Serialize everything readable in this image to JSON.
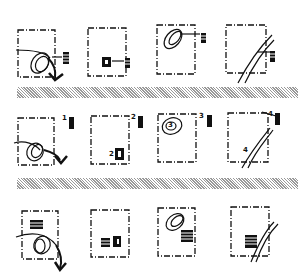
{
  "diagram": {
    "rows": 3,
    "columns": 4,
    "separators": 2,
    "row2_labels": [
      "1",
      "2",
      "3",
      "4"
    ],
    "panel_labels": [
      "1",
      "2",
      "3",
      "4"
    ],
    "inner_labels": [
      "2",
      "3",
      "4"
    ],
    "colors": {
      "ink": "#111111",
      "separator": "#888888",
      "background": "#ffffff"
    }
  }
}
